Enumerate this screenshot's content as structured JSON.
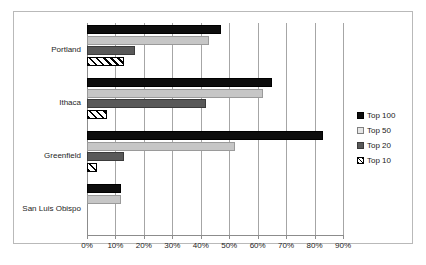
{
  "chart_data": {
    "type": "bar",
    "orientation": "horizontal",
    "title": "",
    "xlabel": "",
    "ylabel": "",
    "xlim": [
      0,
      90
    ],
    "xticks": [
      0,
      10,
      20,
      30,
      40,
      50,
      60,
      70,
      80,
      90
    ],
    "xticklabels": [
      "0%",
      "10%",
      "20%",
      "30%",
      "40%",
      "50%",
      "60%",
      "70%",
      "80%",
      "90%"
    ],
    "grid": "vertical",
    "legend_position": "right",
    "categories": [
      "Portland",
      "Ithaca",
      "Greenfield",
      "San Luis Obispo"
    ],
    "series": [
      {
        "name": "Top 100",
        "color": "#0d0d0d",
        "fill": "solid-black",
        "values": [
          47,
          65,
          83,
          12
        ]
      },
      {
        "name": "Top 50",
        "color": "#c6c6c6",
        "fill": "solid-lightgray",
        "values": [
          43,
          62,
          52,
          12
        ]
      },
      {
        "name": "Top 20",
        "color": "#595959",
        "fill": "solid-darkgray",
        "values": [
          17,
          42,
          13,
          0
        ]
      },
      {
        "name": "Top 10",
        "color": "#ffffff",
        "fill": "diagonal-hatch",
        "values": [
          13,
          7,
          3.5,
          0
        ]
      }
    ]
  },
  "legend": {
    "items": [
      {
        "label": "Top 100"
      },
      {
        "label": "Top 50"
      },
      {
        "label": "Top 20"
      },
      {
        "label": "Top 10"
      }
    ]
  }
}
